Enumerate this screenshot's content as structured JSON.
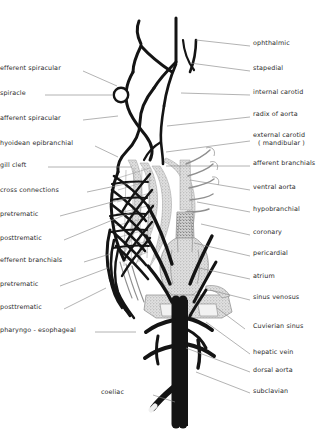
{
  "figure": {
    "colors": {
      "vessel_black": "#141414",
      "vessel_gray": "#8f8f8f",
      "tissue_fill": "#cfcfcf",
      "tissue_fill_light": "#dcdcdc",
      "leader_line": "#8a8a8a",
      "label_text": "#2b2b2b",
      "background": "#ffffff"
    }
  },
  "labels_left": [
    {
      "id": "efferent-spiracular",
      "text": "efferent spiracular",
      "x": 10,
      "y": 69,
      "lx": 83,
      "ly": 71,
      "tx": 117,
      "ty": 86
    },
    {
      "id": "spiracle",
      "text": "spiracle",
      "x": 10,
      "y": 94,
      "lx": 45,
      "ly": 95,
      "tx": 112,
      "ty": 95
    },
    {
      "id": "afferent-spiracular",
      "text": "afferent spiracular",
      "x": 10,
      "y": 119,
      "lx": 83,
      "ly": 120,
      "tx": 118,
      "ty": 116
    },
    {
      "id": "hyoidean-epibranchial",
      "text": "hyoidean epibranchial",
      "x": 10,
      "y": 144,
      "lx": 95,
      "ly": 146,
      "tx": 118,
      "ty": 157
    },
    {
      "id": "gill-cleft",
      "text": "gill cleft",
      "x": 10,
      "y": 166,
      "lx": 48,
      "ly": 167,
      "tx": 132,
      "ty": 167
    },
    {
      "id": "cross-connections",
      "text": "cross connections",
      "x": 10,
      "y": 191,
      "lx": 87,
      "ly": 192,
      "tx": 130,
      "ty": 183
    },
    {
      "id": "pretrematic-1",
      "text": "pretrematic",
      "x": 10,
      "y": 215,
      "lx": 60,
      "ly": 216,
      "tx": 127,
      "ty": 198
    },
    {
      "id": "posttrematic-1",
      "text": "posttrematic",
      "x": 10,
      "y": 239,
      "lx": 64,
      "ly": 240,
      "tx": 132,
      "ty": 212
    },
    {
      "id": "efferent-branchials",
      "text": "efferent branchials",
      "x": 10,
      "y": 261,
      "lx": 84,
      "ly": 262,
      "tx": 110,
      "ty": 254
    },
    {
      "id": "pretrematic-2",
      "text": "pretrematic",
      "x": 10,
      "y": 285,
      "lx": 60,
      "ly": 286,
      "tx": 108,
      "ty": 268
    },
    {
      "id": "posttrematic-2",
      "text": "posttrematic",
      "x": 10,
      "y": 308,
      "lx": 64,
      "ly": 309,
      "tx": 106,
      "ty": 288
    },
    {
      "id": "pharyngo-esophageal",
      "text": "pharyngo - esophageal",
      "x": 10,
      "y": 331,
      "lx": 95,
      "ly": 332,
      "tx": 136,
      "ty": 332
    }
  ],
  "labels_right": [
    {
      "id": "ophthalmic",
      "text": "ophthalmic",
      "x": 253,
      "y": 44,
      "lx": 250,
      "ly": 46,
      "tx": 196,
      "ty": 40
    },
    {
      "id": "stapedial",
      "text": "stapedial",
      "x": 253,
      "y": 69,
      "lx": 250,
      "ly": 71,
      "tx": 190,
      "ty": 63
    },
    {
      "id": "internal-carotid",
      "text": "internal carotid",
      "x": 253,
      "y": 93,
      "lx": 250,
      "ly": 95,
      "tx": 181,
      "ty": 93
    },
    {
      "id": "radix-of-aorta",
      "text": "radix of aorta",
      "x": 253,
      "y": 115,
      "lx": 250,
      "ly": 117,
      "tx": 167,
      "ty": 126
    },
    {
      "id": "external-carotid",
      "text": "external carotid",
      "sub": "( mandibular )",
      "x": 253,
      "y": 136,
      "lx": 250,
      "ly": 141,
      "tx": 166,
      "ty": 152
    },
    {
      "id": "afferent-branchials",
      "text": "afferent branchials",
      "x": 253,
      "y": 164,
      "lx": 250,
      "ly": 166,
      "tx": 166,
      "ty": 166
    },
    {
      "id": "ventral-aorta",
      "text": "ventral aorta",
      "x": 253,
      "y": 188,
      "lx": 250,
      "ly": 190,
      "tx": 190,
      "ty": 180
    },
    {
      "id": "hypobranchial",
      "text": "hypobranchial",
      "x": 253,
      "y": 210,
      "lx": 250,
      "ly": 212,
      "tx": 197,
      "ty": 202
    },
    {
      "id": "coronary",
      "text": "coronary",
      "x": 253,
      "y": 233,
      "lx": 250,
      "ly": 235,
      "tx": 201,
      "ty": 224
    },
    {
      "id": "pericardial",
      "text": "pericardial",
      "x": 253,
      "y": 254,
      "lx": 250,
      "ly": 256,
      "tx": 194,
      "ty": 243
    },
    {
      "id": "atrium",
      "text": "atrium",
      "x": 253,
      "y": 277,
      "lx": 250,
      "ly": 279,
      "tx": 199,
      "ty": 268
    },
    {
      "id": "sinus-venosus",
      "text": "sinus venosus",
      "x": 253,
      "y": 298,
      "lx": 250,
      "ly": 300,
      "tx": 210,
      "ty": 290
    },
    {
      "id": "cuvierian-sinus",
      "text": "Cuvierian sinus",
      "x": 253,
      "y": 327,
      "lx": 245,
      "ly": 329,
      "tx": 217,
      "ty": 308
    },
    {
      "id": "hepatic-vein",
      "text": "hepatic vein",
      "x": 253,
      "y": 353,
      "lx": 250,
      "ly": 354,
      "tx": 206,
      "ty": 322
    },
    {
      "id": "dorsal-aorta",
      "text": "dorsal aorta",
      "x": 253,
      "y": 371,
      "lx": 250,
      "ly": 372,
      "tx": 186,
      "ty": 348
    },
    {
      "id": "subclavian",
      "text": "subclavian",
      "x": 253,
      "y": 392,
      "lx": 250,
      "ly": 393,
      "tx": 196,
      "ty": 372
    }
  ],
  "labels_bottom": [
    {
      "id": "coeliac",
      "text": "coeliac",
      "x": 124,
      "y": 393,
      "lx": 153,
      "ly": 395,
      "tx": 175,
      "ty": 402
    }
  ],
  "caption": {
    "text": ""
  }
}
